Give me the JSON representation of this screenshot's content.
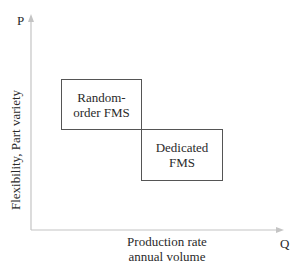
{
  "diagram": {
    "y_axis": {
      "letter": "P",
      "label": "Flexibility, Part variety"
    },
    "x_axis": {
      "letter": "Q",
      "label_line1": "Production rate",
      "label_line2": "annual volume"
    },
    "boxes": [
      {
        "line1": "Random-",
        "line2": "order FMS"
      },
      {
        "line1": "Dedicated",
        "line2": "FMS"
      }
    ],
    "colors": {
      "axis": "#c8c8c8",
      "box_border": "#555555",
      "text": "#2a2a2a"
    }
  }
}
